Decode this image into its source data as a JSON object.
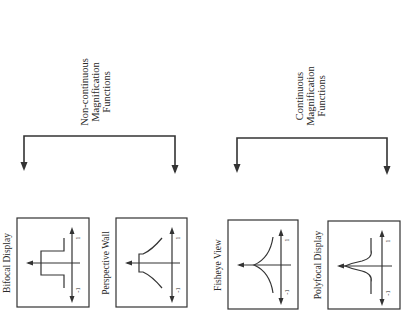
{
  "diagram": {
    "type": "taxonomy-tree",
    "orientation": "rotated-90-ccw",
    "line_color": "#333333",
    "background": "#ffffff",
    "groups": [
      {
        "id": "noncontinuous",
        "title_lines": [
          "Non-continuous",
          "Magnification",
          "Functions"
        ],
        "children": [
          {
            "id": "bifocal",
            "label": "Bifocal Display",
            "curve_shape": "step",
            "axis_labels": {
              "pos": "1",
              "neg": "-1"
            }
          },
          {
            "id": "perspective",
            "label": "Perspective Wall",
            "curve_shape": "step-then-decay",
            "axis_labels": {
              "pos": "1",
              "neg": "-1"
            }
          }
        ]
      },
      {
        "id": "continuous",
        "title_lines": [
          "Continuous",
          "Magnification",
          "Functions"
        ],
        "children": [
          {
            "id": "fisheye",
            "label": "Fisheye View",
            "curve_shape": "cusp",
            "axis_labels": {
              "pos": "1",
              "neg": "-1"
            }
          },
          {
            "id": "polyfocal",
            "label": "Polyfocal Display",
            "curve_shape": "peak-with-dip",
            "axis_labels": {
              "pos": "1",
              "neg": "-1"
            }
          }
        ]
      }
    ]
  }
}
